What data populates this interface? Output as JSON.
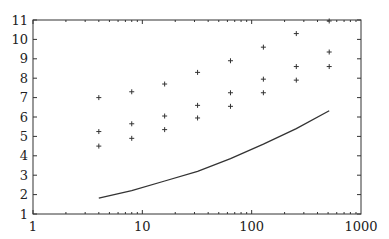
{
  "chart_data": {
    "type": "scatter",
    "title": "",
    "xlabel": "",
    "ylabel": "",
    "xscale": "log",
    "xlim": [
      1,
      1000
    ],
    "ylim": [
      1,
      11
    ],
    "x_ticks": [
      "1",
      "10",
      "100",
      "1000"
    ],
    "y_ticks": [
      "1",
      "2",
      "3",
      "4",
      "5",
      "6",
      "7",
      "8",
      "9",
      "10",
      "11"
    ],
    "grid": false,
    "legend": null,
    "x": [
      4,
      8,
      16,
      32,
      64,
      128,
      256,
      512
    ],
    "series": [
      {
        "name": "upper points",
        "style": "+",
        "values": [
          7.0,
          7.3,
          7.7,
          8.3,
          8.9,
          9.6,
          10.3,
          10.95
        ]
      },
      {
        "name": "middle points",
        "style": "+",
        "values": [
          5.25,
          5.65,
          6.05,
          6.6,
          7.25,
          7.95,
          8.6,
          9.35
        ]
      },
      {
        "name": "lower points",
        "style": "+",
        "values": [
          4.5,
          4.9,
          5.35,
          5.95,
          6.55,
          7.25,
          7.9,
          8.6
        ]
      },
      {
        "name": "line",
        "style": "line",
        "values": [
          1.82,
          2.2,
          2.7,
          3.2,
          3.85,
          4.6,
          5.4,
          6.32
        ]
      }
    ]
  },
  "axes": {
    "x_labels": [
      "1",
      "10",
      "100",
      "1000"
    ],
    "y_labels": [
      "1",
      "2",
      "3",
      "4",
      "5",
      "6",
      "7",
      "8",
      "9",
      "10",
      "11"
    ]
  }
}
